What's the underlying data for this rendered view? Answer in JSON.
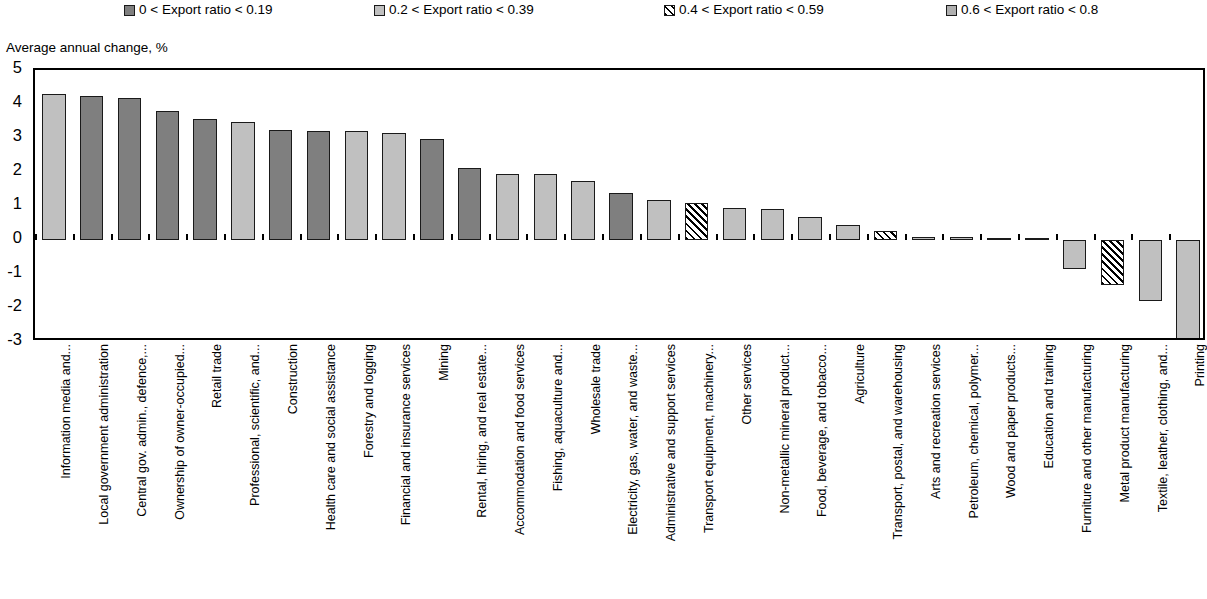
{
  "axis_title": "Average annual change, %",
  "legend": {
    "items": [
      {
        "label": "0 < Export ratio < 0.19",
        "pattern": "solid-dark-gray",
        "color": "#7f7f7f",
        "x": 124
      },
      {
        "label": "0.2 < Export ratio < 0.39",
        "pattern": "solid-light-gray",
        "color": "#c0c0c0",
        "x": 374
      },
      {
        "label": "0.4 < Export ratio < 0.59",
        "pattern": "diagonal-hatch",
        "color": "#ffffff",
        "x": 664
      },
      {
        "label": "0.6 < Export ratio < 0.8",
        "pattern": "solid-mid-gray",
        "color": "#b0b0b0",
        "x": 946
      }
    ]
  },
  "chart_data": {
    "type": "bar",
    "title": "",
    "subtitle": "",
    "xlabel": "",
    "ylabel": "Average annual change, %",
    "ylim": [
      -3,
      5
    ],
    "yticks": [
      5,
      4,
      3,
      2,
      1,
      0,
      -1,
      -2,
      -3
    ],
    "ytick_labels": [
      "5",
      "4",
      "3",
      "2",
      "1",
      "0",
      "-1",
      "-2",
      "-3"
    ],
    "grid": false,
    "legend_position": "top",
    "series_note": "Each bar is shaded by its export-ratio band (see legend)",
    "categories": [
      "Information media and...",
      "Local government administration",
      "Central gov. admin., defence,...",
      "Ownership of owner-occupied...",
      "Retail trade",
      "Professional, scientific, and...",
      "Construction",
      "Health care and social assistance",
      "Forestry and logging",
      "Financial and insurance services",
      "Mining",
      "Rental, hiring, and real estate...",
      "Accommodation and food services",
      "Fishing, aquaculture and...",
      "Wholesale trade",
      "Electricity, gas, water, and waste...",
      "Administrative and support services",
      "Transport equipment, machinery...",
      "Other services",
      "Non-metallic mineral product...",
      "Food, beverage, and tobacco...",
      "Agriculture",
      "Transport, postal, and warehousing",
      "Arts and recreation services",
      "Petroleum, chemical, polymer...",
      "Wood and paper products...",
      "Education and training",
      "Furniture and other manufacturing",
      "Metal product manufacturing",
      "Textile, leather, clothing, and...",
      "Printing"
    ],
    "values": [
      4.28,
      4.25,
      4.18,
      3.78,
      3.57,
      3.48,
      3.23,
      3.22,
      3.2,
      3.14,
      2.97,
      2.12,
      1.95,
      1.93,
      1.73,
      1.37,
      1.17,
      1.1,
      0.95,
      0.92,
      0.67,
      0.43,
      0.26,
      0.1,
      0.08,
      0.07,
      0.06,
      -0.85,
      -1.32,
      -1.78,
      -3.55
    ],
    "bands": [
      "0.2 < Export ratio < 0.39",
      "0 < Export ratio < 0.19",
      "0 < Export ratio < 0.19",
      "0 < Export ratio < 0.19",
      "0 < Export ratio < 0.19",
      "0.2 < Export ratio < 0.39",
      "0 < Export ratio < 0.19",
      "0 < Export ratio < 0.19",
      "0.2 < Export ratio < 0.39",
      "0.2 < Export ratio < 0.39",
      "0 < Export ratio < 0.19",
      "0 < Export ratio < 0.19",
      "0.2 < Export ratio < 0.39",
      "0.2 < Export ratio < 0.39",
      "0.2 < Export ratio < 0.39",
      "0 < Export ratio < 0.19",
      "0.2 < Export ratio < 0.39",
      "0.4 < Export ratio < 0.59",
      "0.2 < Export ratio < 0.39",
      "0.2 < Export ratio < 0.39",
      "0.2 < Export ratio < 0.39",
      "0.2 < Export ratio < 0.39",
      "0.4 < Export ratio < 0.59",
      "0.2 < Export ratio < 0.39",
      "0.2 < Export ratio < 0.39",
      "0.2 < Export ratio < 0.39",
      "0.2 < Export ratio < 0.39",
      "0.2 < Export ratio < 0.39",
      "0.4 < Export ratio < 0.59",
      "0.2 < Export ratio < 0.39",
      "0.2 < Export ratio < 0.39"
    ]
  }
}
